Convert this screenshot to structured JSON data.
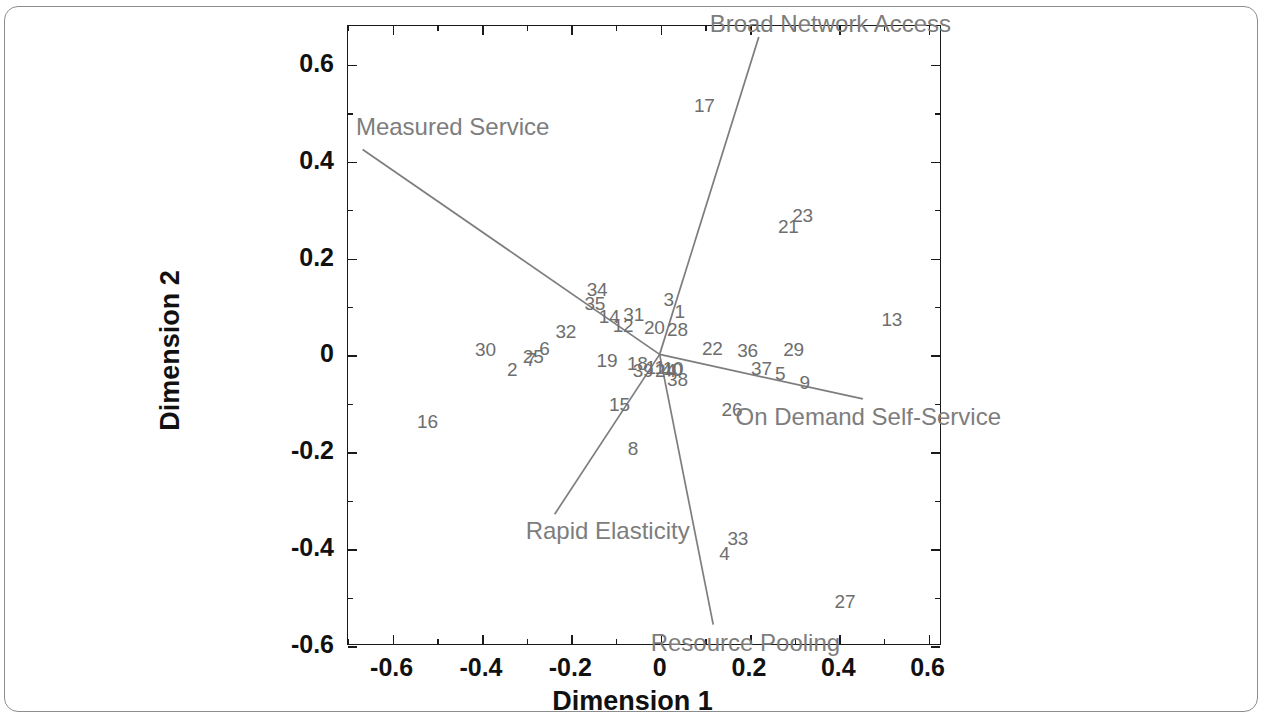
{
  "chart_data": {
    "type": "scatter",
    "title": "",
    "xlabel": "Dimension 1",
    "ylabel": "Dimension 2",
    "xlim": [
      -0.7,
      0.63
    ],
    "ylim": [
      -0.6,
      0.68
    ],
    "grid": false,
    "legend": null,
    "xticks": [
      "-0.6",
      "-0.4",
      "-0.2",
      "0",
      "0.2",
      "0.4",
      "0.6"
    ],
    "xtick_values": [
      -0.6,
      -0.4,
      -0.2,
      0,
      0.2,
      0.4,
      0.6
    ],
    "yticks": [
      "0.6",
      "0.4",
      "0.2",
      "0",
      "-0.2",
      "-0.4",
      "-0.6"
    ],
    "ytick_values": [
      0.6,
      0.4,
      0.2,
      0,
      -0.2,
      -0.4,
      -0.6
    ],
    "point_color": "#6e6e6e",
    "vector_color": "#7d7d7d",
    "axis_color": "#1a1a1a",
    "points": [
      {
        "label": "1",
        "x": 0.045,
        "y": 0.088
      },
      {
        "label": "2",
        "x": -0.33,
        "y": -0.032
      },
      {
        "label": "3",
        "x": 0.02,
        "y": 0.112
      },
      {
        "label": "4",
        "x": 0.145,
        "y": -0.412
      },
      {
        "label": "5",
        "x": 0.27,
        "y": -0.04
      },
      {
        "label": "6",
        "x": -0.258,
        "y": 0.012
      },
      {
        "label": "7",
        "x": -0.288,
        "y": -0.012
      },
      {
        "label": "8",
        "x": -0.06,
        "y": -0.195
      },
      {
        "label": "9",
        "x": 0.325,
        "y": -0.06
      },
      {
        "label": "10",
        "x": 0.03,
        "y": -0.03
      },
      {
        "label": "11",
        "x": -0.01,
        "y": -0.028
      },
      {
        "label": "12",
        "x": -0.082,
        "y": 0.058
      },
      {
        "label": "13",
        "x": 0.52,
        "y": 0.07
      },
      {
        "label": "14",
        "x": -0.113,
        "y": 0.077
      },
      {
        "label": "15",
        "x": -0.09,
        "y": -0.104
      },
      {
        "label": "16",
        "x": -0.52,
        "y": -0.14
      },
      {
        "label": "17",
        "x": 0.1,
        "y": 0.512
      },
      {
        "label": "18",
        "x": -0.05,
        "y": -0.02
      },
      {
        "label": "19",
        "x": -0.118,
        "y": -0.013
      },
      {
        "label": "20",
        "x": -0.012,
        "y": 0.055
      },
      {
        "label": "21",
        "x": 0.288,
        "y": 0.262
      },
      {
        "label": "22",
        "x": 0.118,
        "y": 0.012
      },
      {
        "label": "23",
        "x": 0.32,
        "y": 0.285
      },
      {
        "label": "24",
        "x": 0.013,
        "y": -0.035
      },
      {
        "label": "25",
        "x": -0.283,
        "y": -0.006
      },
      {
        "label": "26",
        "x": 0.162,
        "y": -0.114
      },
      {
        "label": "27",
        "x": 0.415,
        "y": -0.512
      },
      {
        "label": "28",
        "x": 0.04,
        "y": 0.05
      },
      {
        "label": "29",
        "x": 0.3,
        "y": 0.01
      },
      {
        "label": "30",
        "x": -0.39,
        "y": 0.01
      },
      {
        "label": "31",
        "x": -0.058,
        "y": 0.082
      },
      {
        "label": "32",
        "x": -0.21,
        "y": 0.047
      },
      {
        "label": "33",
        "x": 0.175,
        "y": -0.382
      },
      {
        "label": "34",
        "x": -0.14,
        "y": 0.132
      },
      {
        "label": "35",
        "x": -0.145,
        "y": 0.103
      },
      {
        "label": "36",
        "x": 0.197,
        "y": 0.008
      },
      {
        "label": "37",
        "x": 0.228,
        "y": -0.03
      },
      {
        "label": "38",
        "x": 0.04,
        "y": -0.052
      },
      {
        "label": "39",
        "x": -0.037,
        "y": -0.035
      },
      {
        "label": "40",
        "x": 0.028,
        "y": -0.033
      }
    ],
    "vectors": [
      {
        "name": "Measured Service",
        "label": "Measured Service",
        "x1": 0.0,
        "y1": 0.0,
        "x2": -0.665,
        "y2": 0.423,
        "label_x": -0.68,
        "label_y": 0.468,
        "label_anchor": "start"
      },
      {
        "name": "Broad Network Access",
        "label": "Broad Network Access",
        "x1": 0.0,
        "y1": 0.0,
        "x2": 0.222,
        "y2": 0.655,
        "label_x": 0.112,
        "label_y": 0.68,
        "label_anchor": "start"
      },
      {
        "name": "On Demand Self-Service",
        "label": "On Demand Self-Service",
        "x1": 0.0,
        "y1": 0.0,
        "x2": 0.455,
        "y2": -0.092,
        "label_x": 0.17,
        "label_y": -0.132,
        "label_anchor": "start"
      },
      {
        "name": "Rapid Elasticity",
        "label": "Rapid Elasticity",
        "x1": 0.0,
        "y1": 0.0,
        "x2": -0.235,
        "y2": -0.33,
        "label_x": -0.3,
        "label_y": -0.367,
        "label_anchor": "start"
      },
      {
        "name": "Resource Pooling",
        "label": "Resource Pooling",
        "x1": 0.0,
        "y1": 0.0,
        "x2": 0.12,
        "y2": -0.558,
        "label_x": -0.02,
        "label_y": -0.598,
        "label_anchor": "start"
      }
    ]
  },
  "axes": {
    "x_title": "Dimension 1",
    "y_title": "Dimension 2"
  }
}
